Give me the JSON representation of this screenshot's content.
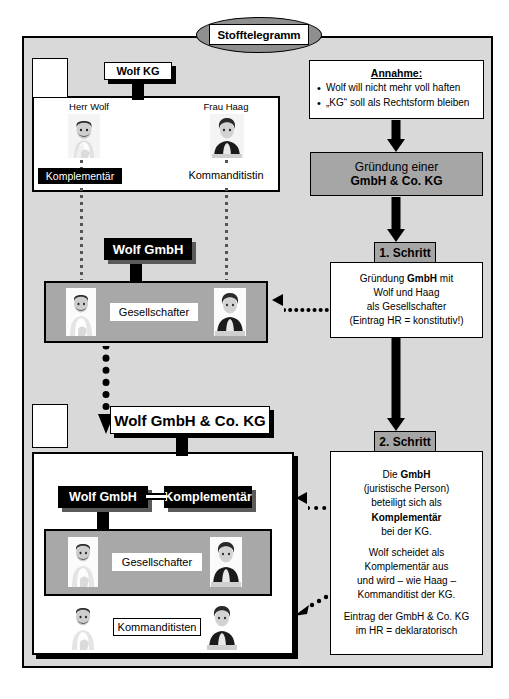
{
  "title": {
    "label": "Stofftelegramm"
  },
  "left_column": {
    "kg_original": {
      "label": "Wolf KG",
      "persons": [
        {
          "name": "Herr Wolf",
          "role": "Komplementär",
          "role_style": "black"
        },
        {
          "name": "Frau Haag",
          "role": "Kommanditistin",
          "role_style": "plain"
        }
      ]
    },
    "gmbh": {
      "label": "Wolf GmbH",
      "panel_label": "Gesellschafter"
    },
    "gmbh_co_kg": {
      "label": "Wolf GmbH & Co. KG",
      "komplementaer_company": "Wolf GmbH",
      "komplementaer_role": "Komplementär",
      "panel_label": "Gesellschafter",
      "kommanditisten_label": "Kommanditisten"
    }
  },
  "right_column": {
    "annahme": {
      "title": "Annahme:",
      "bullets": [
        "Wolf will nicht mehr voll haften",
        "„KG“ soll als Rechtsform bleiben"
      ]
    },
    "gruendung": {
      "line1": "Gründung  einer",
      "line2": "GmbH & Co. KG"
    },
    "schritt1": {
      "badge": "1. Schritt",
      "lines": [
        "Gründung GmbH mit",
        "Wolf und Haag",
        "als Gesellschafter",
        "(Eintrag HR = konstitutiv!)"
      ]
    },
    "schritt2": {
      "badge": "2. Schritt",
      "para1": [
        "Die GmbH",
        "(juristische Person)",
        "beteiligt sich als",
        "Komplementär",
        "bei der KG."
      ],
      "para2": [
        "Wolf scheidet als",
        "Komplementär aus",
        "und wird – wie Haag –",
        "Kommanditist der KG."
      ],
      "para3": [
        "Eintrag der GmbH & Co. KG",
        "im HR = deklaratorisch"
      ]
    }
  },
  "colors": {
    "background": "#d9d9d9",
    "gray_panel": "#a8a8a8",
    "gray_badge": "#a6a6a6",
    "title_ellipse": "#8f8f8f",
    "line": "#000000",
    "paper": "#ffffff"
  }
}
